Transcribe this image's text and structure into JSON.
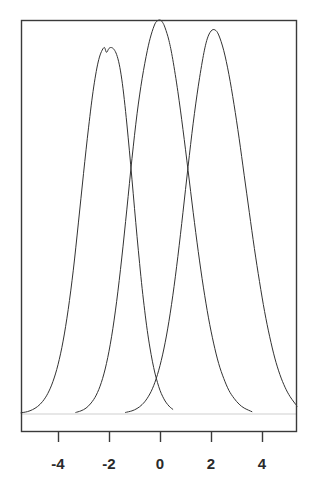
{
  "figure": {
    "title": "",
    "background_color": "#ffffff",
    "width": 317,
    "height": 494
  },
  "axes": {
    "frame_color": "#3a3a3a",
    "frame_left_px": 21,
    "frame_right_px": 297,
    "frame_top_px": 20,
    "frame_bottom_px": 432,
    "baseline_color": "#cfcfcf",
    "baseline_y_px": 414,
    "tick_color": "#3a3a3a",
    "tick_length_px": 10
  },
  "chart_data": {
    "type": "line",
    "title": "",
    "subtitle": "",
    "xlabel": "",
    "ylabel": "",
    "xlim": [
      -5.45,
      5.37
    ],
    "ylim": [
      0,
      1.0
    ],
    "grid": false,
    "legend": null,
    "legend_position": "none",
    "xticks": [
      -4,
      -2,
      0,
      2,
      4
    ],
    "xtick_labels": [
      "-4",
      "-2",
      "0",
      "2",
      "4"
    ],
    "yticks": [],
    "ytick_labels": [],
    "annotations": [],
    "series": [
      {
        "name": "density-left",
        "color": "#333333",
        "line_width": 1,
        "mean": -2.0,
        "peak_value": 0.94,
        "x": [
          -5.45,
          -5.2,
          -5.0,
          -4.8,
          -4.6,
          -4.4,
          -4.2,
          -4.0,
          -3.8,
          -3.6,
          -3.4,
          -3.2,
          -3.0,
          -2.8,
          -2.6,
          -2.4,
          -2.2,
          -2.1,
          -2.0,
          -1.9,
          -1.8,
          -1.7,
          -1.6,
          -1.5,
          -1.4,
          -1.3,
          -1.2,
          -1.1,
          -1.0,
          -0.9,
          -0.8,
          -0.7,
          -0.6,
          -0.5,
          -0.4,
          -0.3,
          -0.2,
          -0.1,
          0.0,
          0.1,
          0.2,
          0.3,
          0.4,
          0.5
        ],
        "y": [
          0.003,
          0.006,
          0.011,
          0.019,
          0.032,
          0.052,
          0.082,
          0.125,
          0.185,
          0.265,
          0.365,
          0.485,
          0.61,
          0.728,
          0.83,
          0.9,
          0.93,
          0.918,
          0.928,
          0.93,
          0.925,
          0.912,
          0.888,
          0.85,
          0.798,
          0.736,
          0.668,
          0.596,
          0.522,
          0.45,
          0.382,
          0.318,
          0.262,
          0.212,
          0.17,
          0.134,
          0.104,
          0.08,
          0.06,
          0.045,
          0.033,
          0.024,
          0.017,
          0.012
        ]
      },
      {
        "name": "density-middle",
        "color": "#333333",
        "line_width": 1,
        "mean": 0.0,
        "peak_value": 1.0,
        "x": [
          -3.3,
          -3.1,
          -2.9,
          -2.7,
          -2.5,
          -2.3,
          -2.1,
          -1.9,
          -1.7,
          -1.5,
          -1.3,
          -1.1,
          -0.9,
          -0.7,
          -0.5,
          -0.35,
          -0.2,
          -0.1,
          0.0,
          0.1,
          0.2,
          0.35,
          0.5,
          0.7,
          0.9,
          1.1,
          1.3,
          1.5,
          1.7,
          1.9,
          2.1,
          2.3,
          2.5,
          2.7,
          2.9,
          3.1,
          3.3,
          3.6
        ],
        "y": [
          0.004,
          0.008,
          0.015,
          0.028,
          0.048,
          0.08,
          0.128,
          0.196,
          0.286,
          0.396,
          0.52,
          0.648,
          0.762,
          0.852,
          0.922,
          0.962,
          0.99,
          0.998,
          1.0,
          0.994,
          0.98,
          0.948,
          0.9,
          0.818,
          0.722,
          0.618,
          0.512,
          0.412,
          0.322,
          0.244,
          0.18,
          0.128,
          0.09,
          0.06,
          0.04,
          0.025,
          0.015,
          0.006
        ]
      },
      {
        "name": "density-right",
        "color": "#333333",
        "line_width": 1,
        "mean": 2.0,
        "peak_value": 0.975,
        "x": [
          -1.35,
          -1.1,
          -0.9,
          -0.7,
          -0.5,
          -0.3,
          -0.1,
          0.1,
          0.3,
          0.5,
          0.7,
          0.9,
          1.1,
          1.3,
          1.5,
          1.7,
          1.85,
          2.0,
          2.15,
          2.3,
          2.5,
          2.7,
          2.9,
          3.1,
          3.3,
          3.5,
          3.7,
          3.9,
          4.1,
          4.3,
          4.5,
          4.7,
          4.9,
          5.1,
          5.37
        ],
        "y": [
          0.004,
          0.008,
          0.014,
          0.024,
          0.04,
          0.064,
          0.1,
          0.15,
          0.216,
          0.3,
          0.4,
          0.512,
          0.628,
          0.738,
          0.832,
          0.91,
          0.952,
          0.972,
          0.975,
          0.962,
          0.922,
          0.862,
          0.786,
          0.7,
          0.606,
          0.512,
          0.42,
          0.336,
          0.26,
          0.196,
          0.142,
          0.1,
          0.068,
          0.044,
          0.02
        ]
      }
    ]
  },
  "tick_labels": [
    {
      "text": "-4",
      "x_px": 58
    },
    {
      "text": "-2",
      "x_px": 109
    },
    {
      "text": "0",
      "x_px": 160
    },
    {
      "text": "2",
      "x_px": 211
    },
    {
      "text": "4",
      "x_px": 262
    }
  ]
}
